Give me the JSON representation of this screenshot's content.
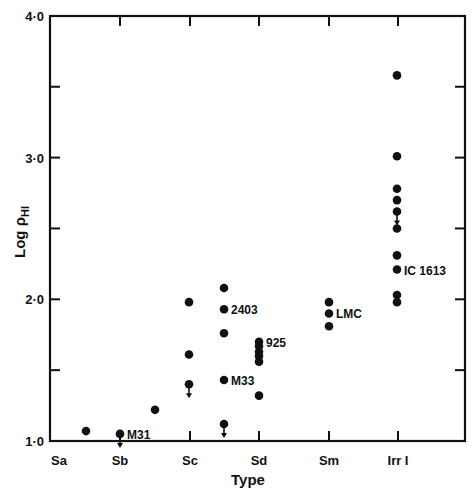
{
  "chart_data": {
    "type": "scatter",
    "title": "",
    "xlabel": "Type",
    "ylabel": "Log ρ_HI",
    "ylabel_main": "Log ρ",
    "ylabel_sub": "HI",
    "categories": [
      "Sa",
      "Sb",
      "Sc",
      "Sd",
      "Sm",
      "Irr I"
    ],
    "ylim": [
      1.0,
      4.0
    ],
    "yticks": [
      1.0,
      1.5,
      2.0,
      2.5,
      3.0,
      3.5,
      4.0
    ],
    "ytick_labels": [
      {
        "value": 1.0,
        "label": "1·0"
      },
      {
        "value": 2.0,
        "label": "2·0"
      },
      {
        "value": 3.0,
        "label": "3·0"
      },
      {
        "value": 4.0,
        "label": "4·0"
      }
    ],
    "grid": false,
    "legend": null,
    "points": [
      {
        "x": 0.5,
        "y": 1.07,
        "upper_limit": false,
        "label": ""
      },
      {
        "x": 1.0,
        "y": 1.05,
        "upper_limit": true,
        "label": "M31"
      },
      {
        "x": 1.5,
        "y": 1.22,
        "upper_limit": false,
        "label": ""
      },
      {
        "x": 2.0,
        "y": 1.98,
        "upper_limit": false,
        "label": ""
      },
      {
        "x": 2.0,
        "y": 1.61,
        "upper_limit": false,
        "label": ""
      },
      {
        "x": 2.0,
        "y": 1.4,
        "upper_limit": true,
        "label": ""
      },
      {
        "x": 2.5,
        "y": 2.08,
        "upper_limit": false,
        "label": ""
      },
      {
        "x": 2.5,
        "y": 1.93,
        "upper_limit": false,
        "label": "2403"
      },
      {
        "x": 2.5,
        "y": 1.76,
        "upper_limit": false,
        "label": ""
      },
      {
        "x": 2.5,
        "y": 1.43,
        "upper_limit": false,
        "label": "M33"
      },
      {
        "x": 2.5,
        "y": 1.12,
        "upper_limit": true,
        "label": ""
      },
      {
        "x": 3.0,
        "y": 1.7,
        "upper_limit": false,
        "label": "925"
      },
      {
        "x": 3.0,
        "y": 1.67,
        "upper_limit": false,
        "label": ""
      },
      {
        "x": 3.0,
        "y": 1.63,
        "upper_limit": false,
        "label": ""
      },
      {
        "x": 3.0,
        "y": 1.6,
        "upper_limit": false,
        "label": ""
      },
      {
        "x": 3.0,
        "y": 1.56,
        "upper_limit": false,
        "label": ""
      },
      {
        "x": 3.0,
        "y": 1.32,
        "upper_limit": false,
        "label": ""
      },
      {
        "x": 4.0,
        "y": 1.98,
        "upper_limit": false,
        "label": ""
      },
      {
        "x": 4.0,
        "y": 1.9,
        "upper_limit": false,
        "label": "LMC"
      },
      {
        "x": 4.0,
        "y": 1.81,
        "upper_limit": false,
        "label": ""
      },
      {
        "x": 5.0,
        "y": 3.58,
        "upper_limit": false,
        "label": ""
      },
      {
        "x": 5.0,
        "y": 3.01,
        "upper_limit": false,
        "label": ""
      },
      {
        "x": 5.0,
        "y": 2.78,
        "upper_limit": false,
        "label": ""
      },
      {
        "x": 5.0,
        "y": 2.7,
        "upper_limit": false,
        "label": ""
      },
      {
        "x": 5.0,
        "y": 2.62,
        "upper_limit": true,
        "label": ""
      },
      {
        "x": 5.0,
        "y": 2.5,
        "upper_limit": false,
        "label": ""
      },
      {
        "x": 5.0,
        "y": 2.31,
        "upper_limit": false,
        "label": ""
      },
      {
        "x": 5.0,
        "y": 2.21,
        "upper_limit": false,
        "label": "IC 1613"
      },
      {
        "x": 5.0,
        "y": 2.03,
        "upper_limit": false,
        "label": ""
      },
      {
        "x": 5.0,
        "y": 1.98,
        "upper_limit": false,
        "label": ""
      }
    ]
  }
}
